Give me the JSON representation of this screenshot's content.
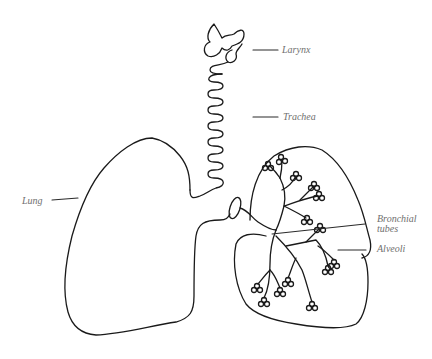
{
  "diagram": {
    "labels": {
      "larynx": "Larynx",
      "trachea": "Trachea",
      "lung": "Lung",
      "bronchial_tubes": "Bronchial tubes",
      "alveoli": "Alveoli"
    },
    "colors": {
      "line": "#1a1a1a",
      "label_text": "#6f6f6f",
      "background": "#ffffff"
    }
  }
}
